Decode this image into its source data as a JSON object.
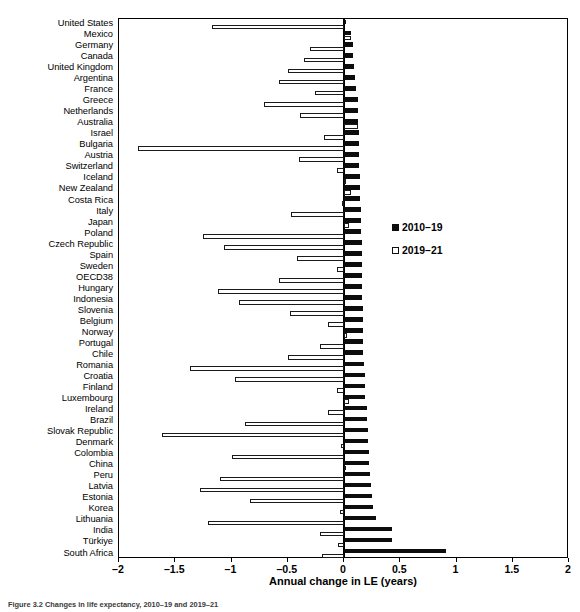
{
  "figure": {
    "caption": "Figure 3.2  Changes in life expectancy, 2010–19 and 2019–21"
  },
  "axis": {
    "x_title": "Annual change in LE (years)",
    "x_min": -2,
    "x_max": 2,
    "ticks": [
      "–2",
      "–1.5",
      "–1",
      "–0.5",
      "0",
      "0.5",
      "1",
      "1.5",
      "2"
    ],
    "tick_values": [
      -2,
      -1.5,
      -1,
      -0.5,
      0,
      0.5,
      1,
      1.5,
      2
    ]
  },
  "legend": {
    "position": "right-middle",
    "entries": [
      {
        "label": "2010–19",
        "style": "filled",
        "color": "#0d0d0d"
      },
      {
        "label": "2019–21",
        "style": "open",
        "color": "#ffffff"
      }
    ]
  },
  "chart_data": {
    "type": "bar",
    "orientation": "horizontal",
    "title": "",
    "xlabel": "Annual change in LE (years)",
    "ylabel": "",
    "xlim": [
      -2,
      2
    ],
    "grid": false,
    "legend_position": "right",
    "categories": [
      "United States",
      "Mexico",
      "Germany",
      "Canada",
      "United Kingdom",
      "Argentina",
      "France",
      "Greece",
      "Netherlands",
      "Australia",
      "Israel",
      "Bulgaria",
      "Austria",
      "Switzerland",
      "Iceland",
      "New Zealand",
      "Costa Rica",
      "Italy",
      "Japan",
      "Poland",
      "Czech Republic",
      "Spain",
      "Sweden",
      "OECD38",
      "Hungary",
      "Indonesia",
      "Slovenia",
      "Belgium",
      "Norway",
      "Portugal",
      "Chile",
      "Romania",
      "Croatia",
      "Finland",
      "Luxembourg",
      "Ireland",
      "Brazil",
      "Slovak Republic",
      "Denmark",
      "Colombia",
      "China",
      "Peru",
      "Latvia",
      "Estonia",
      "Korea",
      "Lithuania",
      "India",
      "Türkiye",
      "South Africa"
    ],
    "series": [
      {
        "name": "2010–19",
        "style": "filled",
        "color": "#0d0d0d",
        "values": [
          0.02,
          0.06,
          0.08,
          0.08,
          0.09,
          0.1,
          0.11,
          0.12,
          0.12,
          0.12,
          0.13,
          0.13,
          0.13,
          0.13,
          0.14,
          0.14,
          0.14,
          0.15,
          0.15,
          0.15,
          0.16,
          0.16,
          0.16,
          0.16,
          0.16,
          0.16,
          0.17,
          0.17,
          0.17,
          0.17,
          0.17,
          0.18,
          0.19,
          0.19,
          0.19,
          0.2,
          0.2,
          0.21,
          0.21,
          0.22,
          0.22,
          0.23,
          0.24,
          0.25,
          0.26,
          0.28,
          0.43,
          0.43,
          0.91
        ]
      },
      {
        "name": "2019–21",
        "style": "open",
        "color": "#ffffff",
        "values": [
          -1.17,
          0.06,
          -0.3,
          -0.36,
          -0.5,
          -0.58,
          -0.26,
          -0.71,
          -0.39,
          0.12,
          -0.18,
          -1.83,
          -0.4,
          -0.06,
          0.02,
          0.06,
          -0.02,
          -0.47,
          0.04,
          -1.25,
          -1.07,
          -0.42,
          -0.06,
          -0.58,
          -1.12,
          -0.93,
          -0.48,
          -0.14,
          0.03,
          -0.21,
          -0.5,
          -1.37,
          -0.97,
          -0.06,
          0.04,
          -0.14,
          -0.88,
          -1.62,
          -0.03,
          -1.0,
          0.0,
          -1.1,
          -1.28,
          -0.84,
          -0.04,
          -1.21,
          -0.21,
          -0.05,
          -0.2
        ]
      }
    ]
  }
}
